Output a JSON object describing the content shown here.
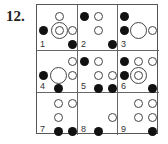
{
  "question_number": "12.",
  "grid": {
    "rows": 3,
    "cols": 3,
    "cells": [
      {
        "label": "1",
        "circles": [
          {
            "type": "open",
            "size": "small",
            "x": 22,
            "y": 11
          },
          {
            "type": "filled",
            "size": "small",
            "x": 6,
            "y": 25
          },
          {
            "type": "open",
            "size": "large",
            "x": 22,
            "y": 25
          },
          {
            "type": "open",
            "size": "small",
            "x": 22,
            "y": 25
          },
          {
            "type": "open",
            "size": "small",
            "x": 35,
            "y": 25
          },
          {
            "type": "filled",
            "size": "small",
            "x": 35,
            "y": 39
          }
        ]
      },
      {
        "label": "2",
        "circles": [
          {
            "type": "filled",
            "size": "small",
            "x": 6,
            "y": 11
          },
          {
            "type": "open",
            "size": "small",
            "x": 20,
            "y": 11
          },
          {
            "type": "open",
            "size": "small",
            "x": 20,
            "y": 25
          },
          {
            "type": "filled",
            "size": "small",
            "x": 34,
            "y": 39
          }
        ]
      },
      {
        "label": "3",
        "circles": [
          {
            "type": "filled",
            "size": "small",
            "x": 6,
            "y": 11
          },
          {
            "type": "filled",
            "size": "small",
            "x": 6,
            "y": 25
          },
          {
            "type": "open",
            "size": "large",
            "x": 20,
            "y": 25
          },
          {
            "type": "open",
            "size": "small",
            "x": 34,
            "y": 25
          }
        ]
      },
      {
        "label": "4",
        "circles": [
          {
            "type": "open",
            "size": "small",
            "x": 35,
            "y": 10
          },
          {
            "type": "filled",
            "size": "small",
            "x": 6,
            "y": 24
          },
          {
            "type": "open",
            "size": "large",
            "x": 21,
            "y": 24
          },
          {
            "type": "open",
            "size": "small",
            "x": 35,
            "y": 24
          },
          {
            "type": "filled",
            "size": "small",
            "x": 21,
            "y": 37
          }
        ]
      },
      {
        "label": "5",
        "circles": [
          {
            "type": "filled",
            "size": "small",
            "x": 6,
            "y": 10
          },
          {
            "type": "open",
            "size": "small",
            "x": 20,
            "y": 10
          },
          {
            "type": "open",
            "size": "small",
            "x": 20,
            "y": 24
          },
          {
            "type": "open",
            "size": "small",
            "x": 34,
            "y": 24
          },
          {
            "type": "filled",
            "size": "small",
            "x": 20,
            "y": 37
          },
          {
            "type": "filled",
            "size": "small",
            "x": 34,
            "y": 37
          }
        ]
      },
      {
        "label": "6",
        "circles": [
          {
            "type": "filled",
            "size": "small",
            "x": 6,
            "y": 10
          },
          {
            "type": "open",
            "size": "small",
            "x": 20,
            "y": 10
          },
          {
            "type": "open",
            "size": "small",
            "x": 34,
            "y": 10
          },
          {
            "type": "filled",
            "size": "small",
            "x": 6,
            "y": 24
          },
          {
            "type": "open",
            "size": "large",
            "x": 20,
            "y": 24
          },
          {
            "type": "open",
            "size": "small",
            "x": 20,
            "y": 24
          },
          {
            "type": "filled",
            "size": "small",
            "x": 34,
            "y": 37
          }
        ]
      },
      {
        "label": "7",
        "circles": [
          {
            "type": "open",
            "size": "small",
            "x": 21,
            "y": 10
          },
          {
            "type": "open",
            "size": "small",
            "x": 35,
            "y": 10
          },
          {
            "type": "open",
            "size": "small",
            "x": 21,
            "y": 24
          },
          {
            "type": "filled",
            "size": "small",
            "x": 21,
            "y": 38
          },
          {
            "type": "filled",
            "size": "small",
            "x": 35,
            "y": 38
          }
        ]
      },
      {
        "label": "8",
        "circles": [
          {
            "type": "open",
            "size": "small",
            "x": 34,
            "y": 24
          },
          {
            "type": "filled",
            "size": "small",
            "x": 20,
            "y": 38
          }
        ]
      },
      {
        "label": "9",
        "circles": [
          {
            "type": "open",
            "size": "small",
            "x": 20,
            "y": 10
          },
          {
            "type": "open",
            "size": "small",
            "x": 34,
            "y": 10
          },
          {
            "type": "open",
            "size": "small",
            "x": 20,
            "y": 24
          },
          {
            "type": "open",
            "size": "small",
            "x": 34,
            "y": 24
          },
          {
            "type": "filled",
            "size": "small",
            "x": 34,
            "y": 38
          }
        ]
      }
    ]
  },
  "colors": {
    "filled": "#111111",
    "open_stroke": "#444444",
    "grid_line": "#666666"
  }
}
